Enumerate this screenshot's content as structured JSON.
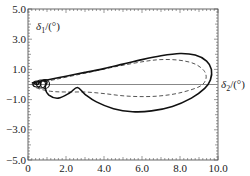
{
  "chart_data": {
    "type": "line",
    "title": "",
    "xlabel": "δ2/(°)",
    "ylabel": "δ1/(°)",
    "xlim": [
      0,
      10
    ],
    "ylim": [
      -5,
      5
    ],
    "x_ticks": [
      "0",
      "2.0",
      "4.0",
      "6.0",
      "8.0",
      "10.0"
    ],
    "y_ticks": [
      "5.0",
      "3.0",
      "1.0",
      "-1.0",
      "-3.0",
      "-5.0"
    ],
    "grid": false,
    "legend": null,
    "reference_line": {
      "y": 0,
      "style": "solid gray"
    },
    "series": [
      {
        "name": "solid",
        "style": "solid",
        "points": [
          [
            0.2,
            0.1
          ],
          [
            1.0,
            0.3
          ],
          [
            2.0,
            0.55
          ],
          [
            3.0,
            0.8
          ],
          [
            4.0,
            1.05
          ],
          [
            5.0,
            1.35
          ],
          [
            6.0,
            1.65
          ],
          [
            7.0,
            1.9
          ],
          [
            8.0,
            2.05
          ],
          [
            8.8,
            1.95
          ],
          [
            9.4,
            1.55
          ],
          [
            9.65,
            1.0
          ],
          [
            9.6,
            0.3
          ],
          [
            9.3,
            -0.25
          ],
          [
            8.6,
            -0.9
          ],
          [
            7.6,
            -1.45
          ],
          [
            6.5,
            -1.75
          ],
          [
            5.5,
            -1.8
          ],
          [
            4.5,
            -1.6
          ],
          [
            3.6,
            -1.15
          ],
          [
            3.0,
            -0.65
          ],
          [
            2.6,
            -0.2
          ],
          [
            2.2,
            -0.55
          ],
          [
            1.6,
            -0.9
          ],
          [
            1.1,
            -0.7
          ],
          [
            0.9,
            -0.2
          ],
          [
            1.0,
            0.15
          ],
          [
            0.7,
            0.25
          ],
          [
            0.5,
            0.0
          ],
          [
            0.3,
            0.1
          ]
        ]
      },
      {
        "name": "dashed",
        "style": "dashed",
        "points": [
          [
            0.2,
            0.0
          ],
          [
            1.5,
            0.35
          ],
          [
            3.0,
            0.75
          ],
          [
            4.5,
            1.15
          ],
          [
            6.0,
            1.5
          ],
          [
            7.0,
            1.65
          ],
          [
            8.0,
            1.6
          ],
          [
            8.8,
            1.35
          ],
          [
            9.3,
            0.85
          ],
          [
            9.35,
            0.3
          ],
          [
            9.0,
            -0.15
          ],
          [
            8.0,
            -0.55
          ],
          [
            7.0,
            -0.75
          ],
          [
            6.0,
            -0.8
          ],
          [
            5.0,
            -0.75
          ],
          [
            4.0,
            -0.6
          ],
          [
            3.0,
            -0.5
          ],
          [
            2.0,
            -0.5
          ],
          [
            1.2,
            -0.45
          ],
          [
            0.5,
            -0.25
          ],
          [
            0.2,
            0.0
          ]
        ]
      }
    ]
  },
  "axes": {
    "x_label_symbol": "δ",
    "x_label_sub": "2",
    "x_label_unit": "/(°)",
    "y_label_symbol": "δ",
    "y_label_sub": "1",
    "y_label_unit": "/(°)"
  }
}
